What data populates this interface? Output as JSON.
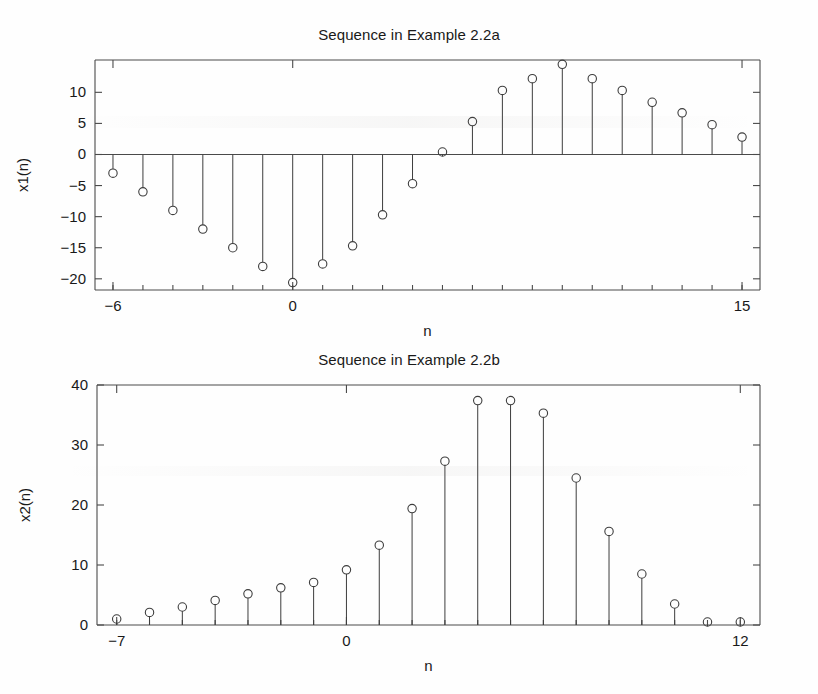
{
  "page": {
    "background": "#fefefe",
    "ink_color": "#3d3d3d",
    "axis_color": "#4a4a4a"
  },
  "figures": [
    {
      "id": "fig1",
      "title": "Sequence in Example 2.2a",
      "xlabel": "n",
      "ylabel": "x1(n)"
    },
    {
      "id": "fig2",
      "title": "Sequence in Example 2.2b",
      "xlabel": "n",
      "ylabel": "x2(n)"
    }
  ],
  "chart_data": [
    {
      "type": "line",
      "subtype": "stem",
      "title": "Sequence in Example 2.2a",
      "xlabel": "n",
      "ylabel": "x1(n)",
      "xlim": [
        -6.6,
        15.6
      ],
      "ylim": [
        -21.8,
        15.2
      ],
      "xticks": [
        -6,
        0,
        15
      ],
      "xticklabels": [
        "−6",
        "0",
        "15"
      ],
      "xminorticks": [
        -6,
        -5,
        -4,
        -3,
        -2,
        -1,
        0,
        1,
        2,
        3,
        4,
        5,
        6,
        7,
        8,
        9,
        10,
        11,
        12,
        13,
        14,
        15
      ],
      "yticks": [
        10,
        5,
        0,
        -5,
        -10,
        -15,
        -20
      ],
      "yticklabels": [
        "10",
        "5",
        "0",
        "−5",
        "−10",
        "−15",
        "−20"
      ],
      "grid": false,
      "legend": null,
      "x": [
        -6,
        -5,
        -4,
        -3,
        -2,
        -1,
        0,
        1,
        2,
        3,
        4,
        5,
        6,
        7,
        8,
        9,
        10,
        11,
        12,
        13,
        14,
        15
      ],
      "values": [
        -3.0,
        -6.0,
        -9.0,
        -12.0,
        -15.0,
        -18.0,
        -20.6,
        -17.6,
        -14.7,
        -9.7,
        -4.7,
        0.4,
        5.3,
        10.3,
        12.2,
        14.5,
        12.2,
        10.3,
        8.4,
        6.7,
        4.8,
        2.8
      ]
    },
    {
      "type": "line",
      "subtype": "stem",
      "title": "Sequence in Example 2.2b",
      "xlabel": "n",
      "ylabel": "x2(n)",
      "xlim": [
        -7.6,
        12.6
      ],
      "ylim": [
        0,
        40
      ],
      "xticks": [
        -7,
        0,
        12
      ],
      "xticklabels": [
        "−7",
        "0",
        "12"
      ],
      "xminorticks": [
        -7,
        -6,
        -5,
        -4,
        -3,
        -2,
        -1,
        0,
        1,
        2,
        3,
        4,
        5,
        6,
        7,
        8,
        9,
        10,
        11,
        12
      ],
      "yticks": [
        0,
        10,
        20,
        30,
        40
      ],
      "yticklabels": [
        "0",
        "10",
        "20",
        "30",
        "40"
      ],
      "grid": false,
      "legend": null,
      "x": [
        -7,
        -6,
        -5,
        -4,
        -3,
        -2,
        -1,
        0,
        1,
        2,
        3,
        4,
        5,
        6,
        7,
        8,
        9,
        10,
        11,
        12
      ],
      "values": [
        1.0,
        2.1,
        3.0,
        4.1,
        5.2,
        6.2,
        7.1,
        9.2,
        13.3,
        19.4,
        27.3,
        37.4,
        37.4,
        35.3,
        24.5,
        15.6,
        8.5,
        3.5,
        0.5,
        0.5
      ]
    }
  ]
}
